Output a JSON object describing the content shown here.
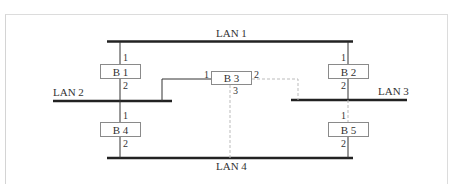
{
  "diagram": {
    "type": "bridged-lan-topology",
    "lans": [
      {
        "id": "lan1",
        "label": "LAN 1"
      },
      {
        "id": "lan2",
        "label": "LAN 2"
      },
      {
        "id": "lan3",
        "label": "LAN 3"
      },
      {
        "id": "lan4",
        "label": "LAN 4"
      }
    ],
    "bridges": [
      {
        "id": "b1",
        "label": "B 1",
        "ports": [
          "1",
          "2"
        ]
      },
      {
        "id": "b2",
        "label": "B 2",
        "ports": [
          "1",
          "2"
        ]
      },
      {
        "id": "b3",
        "label": "B 3",
        "ports": [
          "1",
          "2",
          "3"
        ]
      },
      {
        "id": "b4",
        "label": "B 4",
        "ports": [
          "1",
          "2"
        ]
      },
      {
        "id": "b5",
        "label": "B 5",
        "ports": [
          "1",
          "2"
        ]
      }
    ],
    "links": [
      {
        "bridge": "B 1",
        "port": "1",
        "lan": "LAN 1",
        "style": "solid"
      },
      {
        "bridge": "B 1",
        "port": "2",
        "lan": "LAN 2",
        "style": "solid"
      },
      {
        "bridge": "B 2",
        "port": "1",
        "lan": "LAN 1",
        "style": "solid"
      },
      {
        "bridge": "B 2",
        "port": "2",
        "lan": "LAN 3",
        "style": "solid"
      },
      {
        "bridge": "B 3",
        "port": "1",
        "lan": "LAN 2",
        "style": "solid"
      },
      {
        "bridge": "B 3",
        "port": "2",
        "lan": "LAN 3",
        "style": "dashed"
      },
      {
        "bridge": "B 3",
        "port": "3",
        "lan": "LAN 4",
        "style": "dashed"
      },
      {
        "bridge": "B 4",
        "port": "1",
        "lan": "LAN 2",
        "style": "solid"
      },
      {
        "bridge": "B 4",
        "port": "2",
        "lan": "LAN 4",
        "style": "solid"
      },
      {
        "bridge": "B 5",
        "port": "1",
        "lan": "LAN 3",
        "style": "dashed"
      },
      {
        "bridge": "B 5",
        "port": "2",
        "lan": "LAN 4",
        "style": "solid"
      }
    ],
    "colors": {
      "line": "#222222",
      "dashed": "#bbbbbb",
      "box_border": "#8a8a8a",
      "text": "#333333"
    }
  }
}
